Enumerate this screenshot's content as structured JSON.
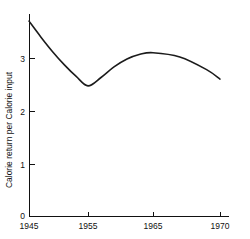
{
  "chart_data": {
    "type": "line",
    "title": "",
    "subtitle": "",
    "xlabel": "",
    "ylabel": "Calorie return per Calorie input",
    "xlim": [
      1945,
      1971.5
    ],
    "ylim": [
      0,
      4.1
    ],
    "xticks": [
      1945,
      1955,
      1965,
      1970
    ],
    "xticklabels": [
      "1945",
      "1955",
      "1965",
      "1970"
    ],
    "yticks": [
      0,
      1,
      2,
      3
    ],
    "yticklabels": [
      "0",
      "1",
      "2",
      "3"
    ],
    "grid": false,
    "legend": null,
    "annotations": [],
    "series": [
      {
        "name": "Calorie return per Calorie input",
        "color": "#1b1b1b",
        "x": [
          1945,
          1947,
          1949,
          1951,
          1953,
          1955,
          1957,
          1959,
          1961,
          1963,
          1965,
          1967,
          1969,
          1970
        ],
        "values": [
          3.7,
          3.4,
          3.12,
          2.87,
          2.65,
          2.47,
          2.63,
          2.83,
          2.98,
          3.07,
          3.1,
          3.02,
          2.78,
          2.6
        ]
      }
    ],
    "key_points": {
      "start": {
        "x": 1945,
        "y": 3.7
      },
      "minimum": {
        "x": 1955,
        "y": 2.47
      },
      "maximum": {
        "x": 1965,
        "y": 3.1
      },
      "end": {
        "x": 1970,
        "y": 2.6
      }
    }
  },
  "axes": {
    "y_axis_title": "Calorie return per Calorie input",
    "x_tick_labels": [
      "1945",
      "1955",
      "1965",
      "1970"
    ],
    "y_tick_labels": [
      "0",
      "1",
      "2",
      "3"
    ]
  },
  "colors": {
    "background": "#ffffff",
    "axis": "#111111",
    "curve": "#1b1b1b",
    "text": "#111111"
  }
}
